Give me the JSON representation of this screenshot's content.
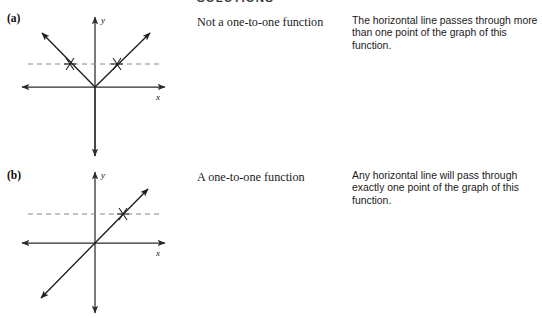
{
  "document": {
    "heading": "SOLUTIONS",
    "rows": [
      {
        "part_label": "(a)",
        "caption": "Not a one-to-one function",
        "description": "The horizontal line passes through more than one point of the graph of this function.",
        "figure": {
          "name": "absolute-value-graph",
          "axis_x_label": "x",
          "axis_y_label": "y",
          "curve_type": "v-shape",
          "intersection_count": 2
        }
      },
      {
        "part_label": "(b)",
        "caption": "A one-to-one function",
        "description": "Any horizontal line will pass through exactly one point of the graph of this function.",
        "figure": {
          "name": "linear-graph",
          "axis_x_label": "x",
          "axis_y_label": "y",
          "curve_type": "diagonal-line",
          "intersection_count": 1
        }
      }
    ]
  },
  "colors": {
    "ink": "#111111",
    "axis": "#2b2b2b",
    "curve": "#1d1d1d",
    "dashed": "#8a8a8a",
    "background": "#ffffff"
  }
}
